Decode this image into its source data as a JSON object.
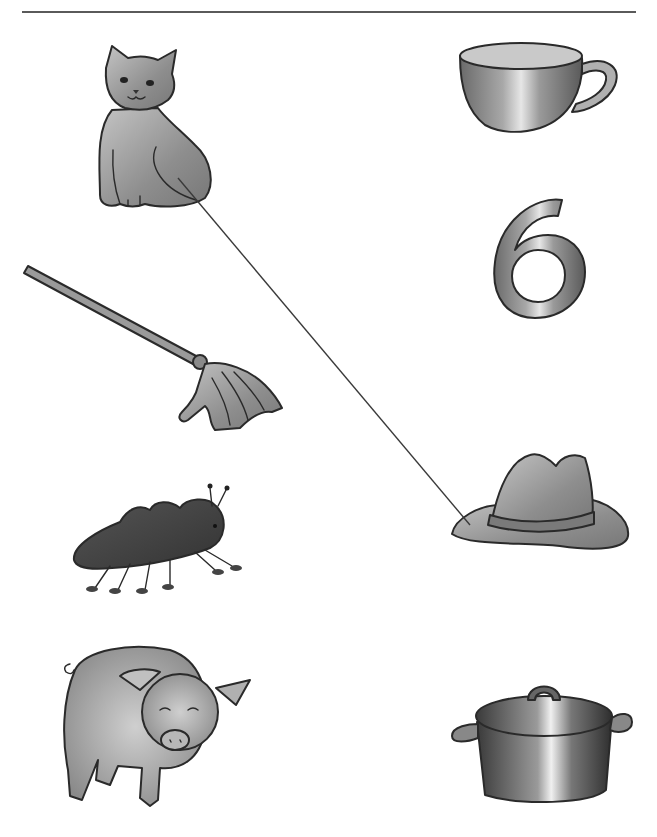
{
  "worksheet": {
    "type": "matching-exercise",
    "left_column": [
      {
        "id": "cat",
        "label": "cat"
      },
      {
        "id": "mop",
        "label": "mop"
      },
      {
        "id": "ant",
        "label": "ant"
      },
      {
        "id": "pig",
        "label": "pig"
      }
    ],
    "right_column": [
      {
        "id": "cup",
        "label": "cup"
      },
      {
        "id": "six",
        "label": "6"
      },
      {
        "id": "hat",
        "label": "hat"
      },
      {
        "id": "pot",
        "label": "pot"
      }
    ],
    "connections": [
      {
        "from": "cat",
        "to": "hat"
      }
    ],
    "colors": {
      "outline": "#2a2a2a",
      "fill_gray": "#9a9a9a",
      "line": "#3a3a3a"
    }
  }
}
